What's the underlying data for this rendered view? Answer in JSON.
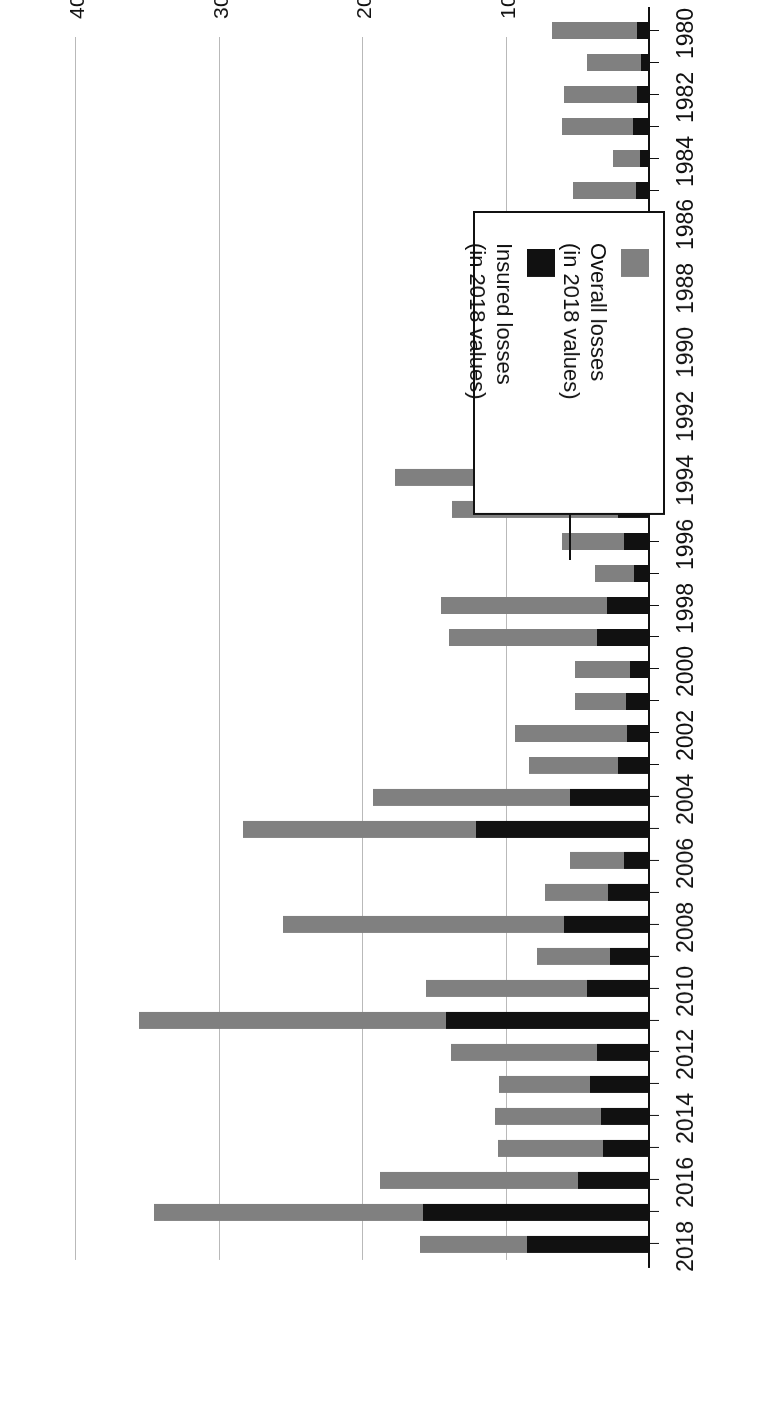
{
  "chart_data": {
    "type": "bar",
    "orientation": "horizontal",
    "stacked": true,
    "title": "",
    "xlabel": "US$ bn",
    "ylabel": "",
    "xlim": [
      0,
      430
    ],
    "xticks": [
      100,
      200,
      300,
      400
    ],
    "xticklabels": [
      "100",
      "200",
      "300",
      "400"
    ],
    "grid": "vertical",
    "legend_position": "inside-lower-left",
    "legend": [
      {
        "name": "Overall losses",
        "sub": "(in 2018 values)",
        "color": "#808080"
      },
      {
        "name": "Insured losses",
        "sub": "(in 2018 values)",
        "color": "#111111"
      }
    ],
    "categories": [
      "1980",
      "1981",
      "1982",
      "1983",
      "1984",
      "1985",
      "1986",
      "1987",
      "1988",
      "1989",
      "1990",
      "1991",
      "1992",
      "1993",
      "1994",
      "1995",
      "1996",
      "1997",
      "1998",
      "1999",
      "2000",
      "2001",
      "2002",
      "2003",
      "2004",
      "2005",
      "2006",
      "2007",
      "2008",
      "2009",
      "2010",
      "2011",
      "2012",
      "2013",
      "2014",
      "2015",
      "2016",
      "2017",
      "2018"
    ],
    "categories_shown": [
      "1980",
      "1982",
      "1984",
      "1986",
      "1988",
      "1990",
      "1992",
      "1994",
      "1996",
      "1998",
      "2000",
      "2002",
      "2004",
      "2006",
      "2008",
      "2010",
      "2012",
      "2014",
      "2016",
      "2018"
    ],
    "series": [
      {
        "name": "Overall losses",
        "color": "#808080",
        "values": [
          68,
          44,
          60,
          61,
          26,
          54,
          39,
          62,
          101,
          75,
          69,
          72,
          106,
          73,
          178,
          138,
          61,
          38,
          146,
          140,
          52,
          52,
          94,
          84,
          193,
          284,
          56,
          73,
          256,
          79,
          156,
          356,
          139,
          105,
          108,
          106,
          188,
          346,
          160
        ]
      },
      {
        "name": "Insured losses",
        "color": "#111111",
        "values": [
          9,
          6,
          9,
          12,
          7,
          10,
          9,
          10,
          10,
          16,
          26,
          25,
          38,
          21,
          36,
          22,
          18,
          11,
          30,
          37,
          14,
          17,
          16,
          22,
          56,
          121,
          18,
          29,
          60,
          28,
          44,
          142,
          37,
          42,
          34,
          33,
          50,
          158,
          86
        ]
      }
    ]
  },
  "axis": {
    "x_title": "US$ bn"
  }
}
